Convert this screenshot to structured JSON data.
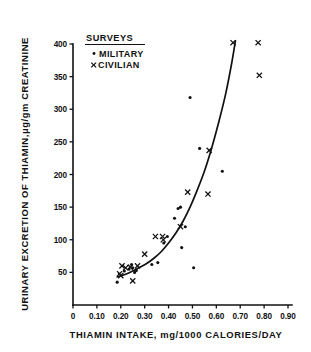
{
  "figure": {
    "name": "thiamin-excretion-vs-intake-scatter"
  },
  "axes": {
    "y_title": "URINARY EXCRETION OF THIAMIN,μg/gm CREATININE",
    "x_title": "THIAMIN INTAKE,  mg/1000 CALORIES/DAY",
    "y_ticks": [
      "50",
      "100",
      "150",
      "200",
      "250",
      "300",
      "350",
      "400"
    ],
    "x_ticks": [
      "0",
      "0.10",
      "0.20",
      "0.30",
      "0.40",
      "0.50",
      "0.60",
      "0.70",
      "0.80",
      "0.90"
    ]
  },
  "legend": {
    "title": "SURVEYS",
    "items": [
      {
        "marker": "dot-marker",
        "label": "MILITARY"
      },
      {
        "marker": "cross-marker",
        "label": "CIVILIAN"
      }
    ]
  },
  "chart_data": {
    "type": "scatter",
    "title": "",
    "xlabel": "THIAMIN INTAKE,  mg/1000 CALORIES/DAY",
    "ylabel": "URINARY EXCRETION OF THIAMIN,μg/gm CREATININE",
    "xlim": [
      0.0,
      0.93
    ],
    "ylim": [
      0,
      415
    ],
    "xticks": [
      0.0,
      0.1,
      0.2,
      0.3,
      0.4,
      0.5,
      0.6,
      0.7,
      0.8,
      0.9
    ],
    "yticks": [
      50,
      100,
      150,
      200,
      250,
      300,
      350,
      400
    ],
    "grid": false,
    "legend_position": "upper-left-inside",
    "series": [
      {
        "name": "MILITARY",
        "marker": "dot",
        "color": "#111111",
        "points": [
          [
            0.185,
            35
          ],
          [
            0.215,
            52
          ],
          [
            0.235,
            55
          ],
          [
            0.245,
            62
          ],
          [
            0.25,
            57
          ],
          [
            0.258,
            50
          ],
          [
            0.265,
            53
          ],
          [
            0.33,
            62
          ],
          [
            0.355,
            65
          ],
          [
            0.38,
            95
          ],
          [
            0.395,
            105
          ],
          [
            0.425,
            133
          ],
          [
            0.44,
            148
          ],
          [
            0.45,
            150
          ],
          [
            0.455,
            88
          ],
          [
            0.47,
            120
          ],
          [
            0.49,
            318
          ],
          [
            0.505,
            57
          ],
          [
            0.53,
            240
          ],
          [
            0.625,
            205
          ]
        ]
      },
      {
        "name": "CIVILIAN",
        "marker": "x",
        "color": "#111111",
        "points": [
          [
            0.195,
            48
          ],
          [
            0.2,
            45
          ],
          [
            0.205,
            60
          ],
          [
            0.22,
            57
          ],
          [
            0.24,
            58
          ],
          [
            0.25,
            37
          ],
          [
            0.27,
            60
          ],
          [
            0.3,
            78
          ],
          [
            0.345,
            105
          ],
          [
            0.375,
            105
          ],
          [
            0.378,
            100
          ],
          [
            0.45,
            120
          ],
          [
            0.48,
            173
          ],
          [
            0.565,
            170
          ],
          [
            0.57,
            237
          ],
          [
            0.67,
            402
          ],
          [
            0.775,
            402
          ],
          [
            0.78,
            352
          ]
        ]
      }
    ],
    "fit_curve": {
      "name": "fitted-exponential-trend",
      "points": [
        [
          0.185,
          43
        ],
        [
          0.22,
          47
        ],
        [
          0.25,
          52
        ],
        [
          0.28,
          58
        ],
        [
          0.31,
          64
        ],
        [
          0.34,
          72
        ],
        [
          0.37,
          82
        ],
        [
          0.4,
          95
        ],
        [
          0.43,
          110
        ],
        [
          0.46,
          128
        ],
        [
          0.49,
          150
        ],
        [
          0.52,
          176
        ],
        [
          0.55,
          205
        ],
        [
          0.58,
          240
        ],
        [
          0.61,
          280
        ],
        [
          0.64,
          325
        ],
        [
          0.665,
          372
        ],
        [
          0.68,
          405
        ]
      ]
    }
  }
}
